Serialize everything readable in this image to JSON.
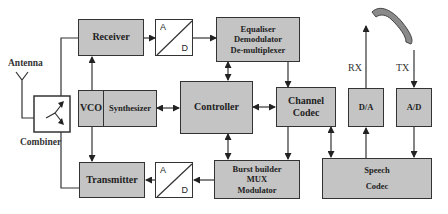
{
  "diagram": {
    "type": "block-diagram",
    "blocks": {
      "receiver": "Receiver",
      "transmitter": "Transmitter",
      "vco": "VCO",
      "synthesizer": "Synthesizer",
      "controller": "Controller",
      "equaliser": [
        "Equaliser",
        "Demodulator",
        "De-multiplexer"
      ],
      "burst_builder": [
        "Burst builder",
        "MUX",
        "Modulator"
      ],
      "channel_codec": [
        "Channel",
        "Codec"
      ],
      "speech_codec": [
        "Speech",
        "Codec"
      ],
      "da": "D/A",
      "ad_right": "A/D",
      "converter_top": {
        "a": "A",
        "d": "D"
      },
      "converter_bottom": {
        "a": "A",
        "d": "D"
      }
    },
    "labels": {
      "antenna": "Antenna",
      "combiner": "Combiner",
      "rx": "RX",
      "tx": "TX"
    },
    "icons": [
      "antenna-icon",
      "combiner-icon",
      "telephone-handset-icon"
    ],
    "connections": [
      "Combiner -> Receiver",
      "Receiver -> A/D (top)",
      "A/D (top) -> Equaliser/Demodulator/De-multiplexer",
      "Equaliser <-> Controller",
      "Equaliser -> Channel Codec",
      "Synthesizer -> Receiver",
      "Synthesizer -> Transmitter",
      "Synthesizer <-> Controller",
      "Controller <-> Channel Codec",
      "Controller <-> Burst builder",
      "Channel Codec -> Burst builder",
      "Channel Codec <-> Speech Codec",
      "Burst builder -> A/D (bottom)",
      "A/D (bottom) -> Transmitter",
      "Transmitter -> Combiner",
      "Speech Codec -> D/A",
      "D/A -> RX (handset)",
      "TX (handset) -> A/D",
      "A/D -> Speech Codec"
    ]
  }
}
